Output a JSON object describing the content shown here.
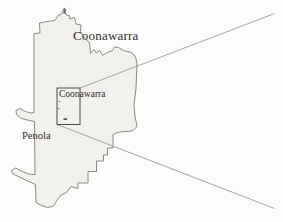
{
  "figure": {
    "type": "map-inset-callout",
    "region_label_large": "Coonawarra",
    "inset_label": "Coonawarra",
    "town_label": "Penola"
  },
  "colors": {
    "background": "#fcfcfb",
    "region_fill": "#f2f1ed",
    "region_stroke": "#8a8985",
    "inset_stroke": "#4b4a46",
    "callout_line": "#9b9b99",
    "label_color": "#2f2e2b",
    "mark_color": "#6f6e69"
  }
}
